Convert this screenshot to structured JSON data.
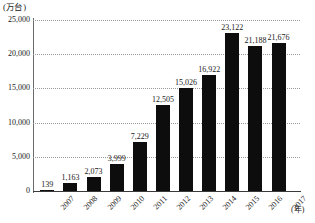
{
  "chart_data": {
    "type": "bar",
    "title": "",
    "subtitle": "",
    "xlabel": "(年)",
    "ylabel": "(万台)",
    "categories": [
      "2007",
      "2008",
      "2009",
      "2010",
      "2011",
      "2012",
      "2013",
      "2014",
      "2015",
      "2016",
      "2017"
    ],
    "values": [
      139,
      1163,
      2073,
      3999,
      7229,
      12505,
      15026,
      16922,
      23122,
      21188,
      21676
    ],
    "value_labels": [
      "139",
      "1,163",
      "2,073",
      "3,999",
      "7,229",
      "12,505",
      "15,026",
      "16,922",
      "23,122",
      "21,188",
      "21,676"
    ],
    "ylim": [
      0,
      25000
    ],
    "yticks": [
      0,
      5000,
      10000,
      15000,
      20000,
      25000
    ],
    "ytick_labels": [
      "0",
      "5,000",
      "10,000",
      "15,000",
      "20,000",
      "25,000"
    ],
    "grid": true,
    "grid_style": "dotted-horizontal",
    "legend": "none",
    "bar_color": "#0d0d0d",
    "axis_color": "#3a3a3a",
    "grid_color": "#9a9a9a",
    "background": "#ffffff"
  },
  "axes": {
    "y_unit_label": "(万台)",
    "x_unit_label": "(年)"
  }
}
